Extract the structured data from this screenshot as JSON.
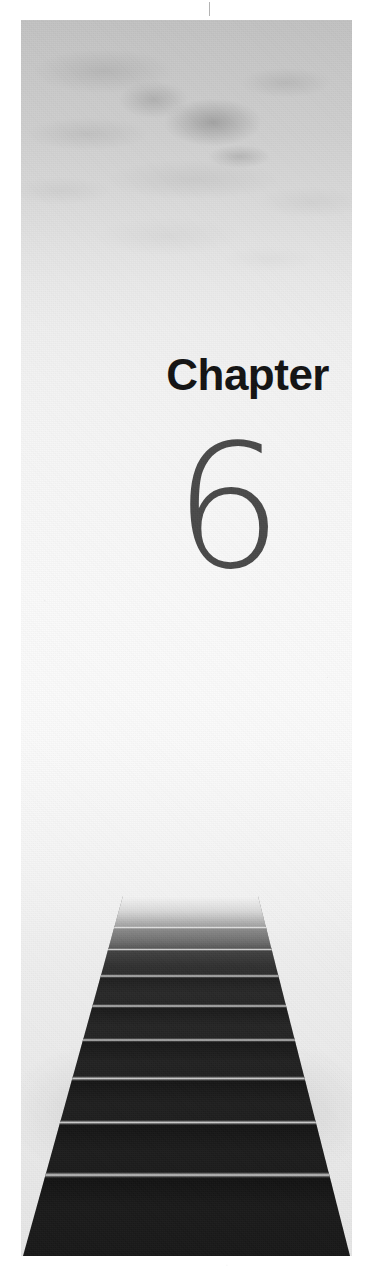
{
  "page": {
    "kind": "book-chapter-opening-page",
    "width": 372,
    "height": 1278,
    "background_color": "#ffffff"
  },
  "chapter": {
    "label": "Chapter",
    "number": "6",
    "label_color": "#121212",
    "number_color": "#494949"
  },
  "photo": {
    "description": "Black and white photograph of a dark staircase ascending into bright mist and clouds",
    "plate_left": 21,
    "plate_top": 20,
    "plate_width": 331,
    "plate_height": 1236,
    "mist_color": "#c2c2c2",
    "highlight_color": "#fbfbfb",
    "stair_dark_color": "#1b1b1b",
    "tread_highlight_color": "#e1e1e1"
  },
  "stairs": {
    "top_edge_inset_percent": [
      30.8,
      71.6
    ],
    "bottom_edge_inset_percent": [
      0.6,
      99.4
    ],
    "treads": [
      {
        "top": 30,
        "height": 3
      },
      {
        "top": 52,
        "height": 3
      },
      {
        "top": 78,
        "height": 4
      },
      {
        "top": 108,
        "height": 4
      },
      {
        "top": 142,
        "height": 4
      },
      {
        "top": 180,
        "height": 5
      },
      {
        "top": 224,
        "height": 5
      },
      {
        "top": 276,
        "height": 6
      }
    ]
  },
  "marks": {
    "registration_tick": "vertical-tick"
  }
}
